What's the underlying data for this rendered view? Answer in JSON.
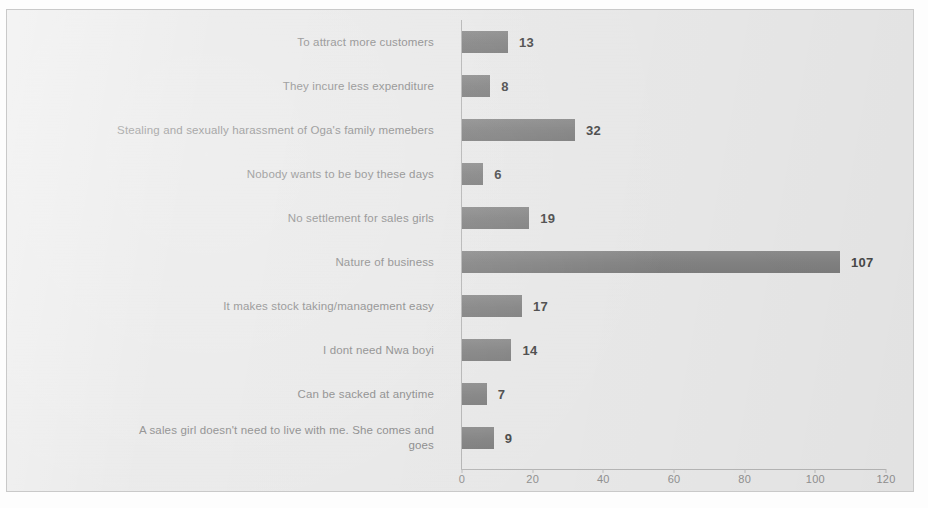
{
  "chart_data": {
    "type": "bar",
    "orientation": "horizontal",
    "title": "",
    "subtitle": "",
    "xlabel": "",
    "ylabel": "",
    "xlim": [
      0,
      120
    ],
    "xticks": [
      0,
      20,
      40,
      60,
      80,
      100,
      120
    ],
    "grid": false,
    "legend": null,
    "data_labels": true,
    "bar_color": "#8a8a8a",
    "label_color": "#8b8b8b",
    "value_color": "#4a4a4a",
    "background_color": "#ececec",
    "categories": [
      "To attract more customers",
      "They incure less expenditure",
      "Stealing and sexually harassment of Oga's family memebers",
      "Nobody wants to be boy these days",
      "No settlement for sales girls",
      "Nature of business",
      "It makes stock taking/management easy",
      "I dont need Nwa boyi",
      "Can be sacked at anytime",
      "A sales girl doesn't need to live with me. She comes and\ngoes"
    ],
    "values": [
      13,
      8,
      32,
      6,
      19,
      107,
      17,
      14,
      7,
      9
    ],
    "value_labels": [
      "13",
      "8",
      "32",
      "6",
      "19",
      "107",
      "17",
      "14",
      "7",
      "9"
    ]
  }
}
